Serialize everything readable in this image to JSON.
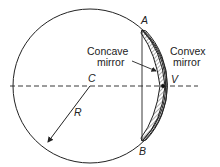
{
  "diagram": {
    "points": {
      "center": "C",
      "vertex": "V",
      "top": "A",
      "bottom": "B",
      "radius": "R"
    },
    "labels": {
      "concave_line1": "Concave",
      "concave_line2": "mirror",
      "convex_line1": "Convex",
      "convex_line2": "mirror"
    },
    "colors": {
      "stroke": "#222222",
      "background": "#ffffff"
    }
  }
}
